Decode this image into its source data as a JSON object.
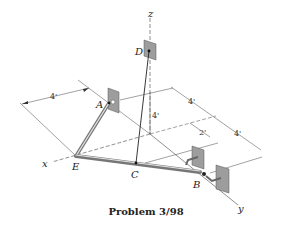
{
  "figure": {
    "title": "Problem 3/98",
    "axes": {
      "x": "x",
      "y": "y",
      "z": "z"
    },
    "points": {
      "A": "A",
      "B": "B",
      "C": "C",
      "D": "D",
      "E": "E"
    },
    "dimensions": {
      "left_width": "4'",
      "height_D": "4'",
      "right_upper": "4'",
      "right_offset": "2'",
      "right_lower": "4'"
    }
  }
}
